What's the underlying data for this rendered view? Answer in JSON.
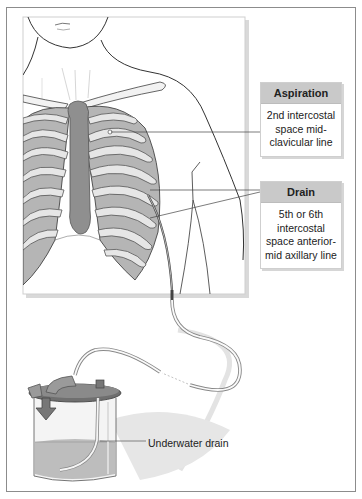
{
  "figure": {
    "callouts": [
      {
        "id": "aspiration",
        "heading": "Aspiration",
        "text": "2nd intercostal space mid-clavicular line"
      },
      {
        "id": "drain",
        "heading": "Drain",
        "text": "5th or 6th intercostal space anterior-mid axillary line"
      }
    ],
    "labels": {
      "underwater_drain": "Underwater drain"
    },
    "colors": {
      "frame_border": "#8c8c8c",
      "callout_header": "#c9c9c9",
      "rib_fill": "#a8a8a8",
      "rib_highlight": "#e6e6e6",
      "sternum": "#8f8f8f",
      "outline": "#333333",
      "water": "#bdbdbd"
    }
  }
}
